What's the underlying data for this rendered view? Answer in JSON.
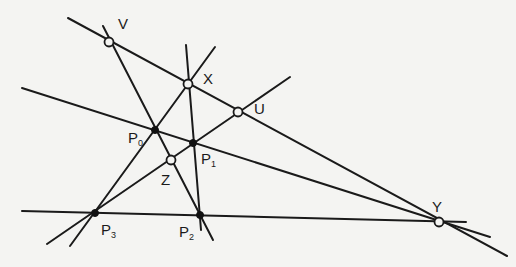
{
  "diagram": {
    "points": [
      {
        "id": "V",
        "label": "V",
        "x": 109,
        "y": 42,
        "style": "open"
      },
      {
        "id": "X",
        "label": "X",
        "x": 188,
        "y": 84,
        "style": "open"
      },
      {
        "id": "U",
        "label": "U",
        "x": 238,
        "y": 112,
        "style": "open"
      },
      {
        "id": "Z",
        "label": "Z",
        "x": 171,
        "y": 160,
        "style": "open"
      },
      {
        "id": "Y",
        "label": "Y",
        "x": 439,
        "y": 222,
        "style": "open"
      },
      {
        "id": "P0",
        "label": "P",
        "sub": "0",
        "x": 155,
        "y": 130,
        "style": "solid"
      },
      {
        "id": "P1",
        "label": "P",
        "sub": "1",
        "x": 193,
        "y": 143,
        "style": "solid"
      },
      {
        "id": "P2",
        "label": "P",
        "sub": "2",
        "x": 200,
        "y": 215,
        "style": "solid"
      },
      {
        "id": "P3",
        "label": "P",
        "sub": "3",
        "x": 95,
        "y": 213,
        "style": "solid"
      }
    ],
    "lines": [
      {
        "name": "line-VXUY",
        "x1": 68,
        "y1": 18,
        "x2": 507,
        "y2": 256
      },
      {
        "name": "line-P0P1Y",
        "x1": 22,
        "y1": 88,
        "x2": 490,
        "y2": 237
      },
      {
        "name": "line-P3P2Y",
        "x1": 22,
        "y1": 211,
        "x2": 466,
        "y2": 222
      },
      {
        "name": "line-VP0ZP2",
        "x1": 103,
        "y1": 26,
        "x2": 213,
        "y2": 240
      },
      {
        "name": "line-XP1P2",
        "x1": 186,
        "y1": 45,
        "x2": 201,
        "y2": 230
      },
      {
        "name": "line-P3P0X",
        "x1": 70,
        "y1": 246,
        "x2": 215,
        "y2": 47
      },
      {
        "name": "line-P3ZP1U",
        "x1": 47,
        "y1": 244,
        "x2": 290,
        "y2": 77
      }
    ],
    "labels": {
      "V": "V",
      "X": "X",
      "U": "U",
      "Z": "Z",
      "Y": "Y",
      "P0": "P",
      "P0_sub": "0",
      "P1": "P",
      "P1_sub": "1",
      "P2": "P",
      "P2_sub": "2",
      "P3": "P",
      "P3_sub": "3"
    }
  }
}
